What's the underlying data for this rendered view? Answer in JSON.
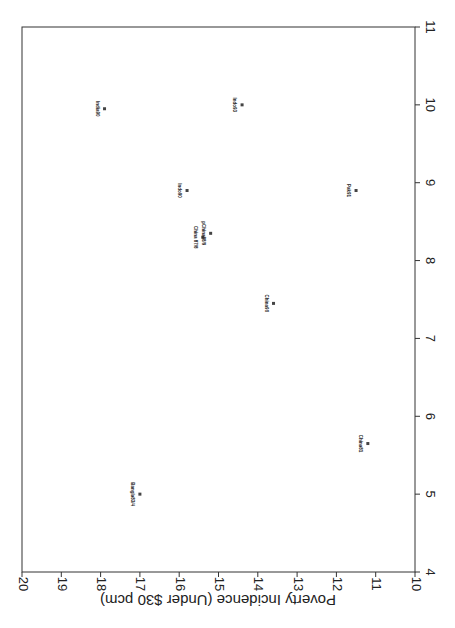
{
  "chart_data": {
    "type": "scatter",
    "title": "",
    "orientation": "rotated 90deg (page scanned sideways)",
    "xlabel": "",
    "ylabel": "Poverty Incidence (Under $30 pcm)",
    "xlim": [
      4,
      11
    ],
    "ylim": [
      10,
      20
    ],
    "x_ticks": [
      "4",
      "5",
      "6",
      "7",
      "8",
      "9",
      "10",
      "11"
    ],
    "y_ticks": [
      "10",
      "11",
      "12",
      "13",
      "14",
      "15",
      "16",
      "17",
      "18",
      "19",
      "20"
    ],
    "grid": false,
    "legend": null,
    "points": [
      {
        "label": "Bangla83/4",
        "x": 5.0,
        "y": 17.0
      },
      {
        "label": "China81",
        "x": 5.65,
        "y": 11.2
      },
      {
        "label": "China90",
        "x": 7.45,
        "y": 13.6
      },
      {
        "label": "China 87/8",
        "x": 8.3,
        "y": 15.4
      },
      {
        "label": "pChina88/9",
        "x": 8.35,
        "y": 15.2
      },
      {
        "label": "Indo90",
        "x": 8.9,
        "y": 15.8
      },
      {
        "label": "Pak91",
        "x": 8.9,
        "y": 11.5
      },
      {
        "label": "India90",
        "x": 9.95,
        "y": 17.9
      },
      {
        "label": "Indo93",
        "x": 10.0,
        "y": 14.4
      }
    ]
  },
  "colors": {
    "axis": "#333333",
    "marker": "#444444",
    "background": "#ffffff"
  }
}
